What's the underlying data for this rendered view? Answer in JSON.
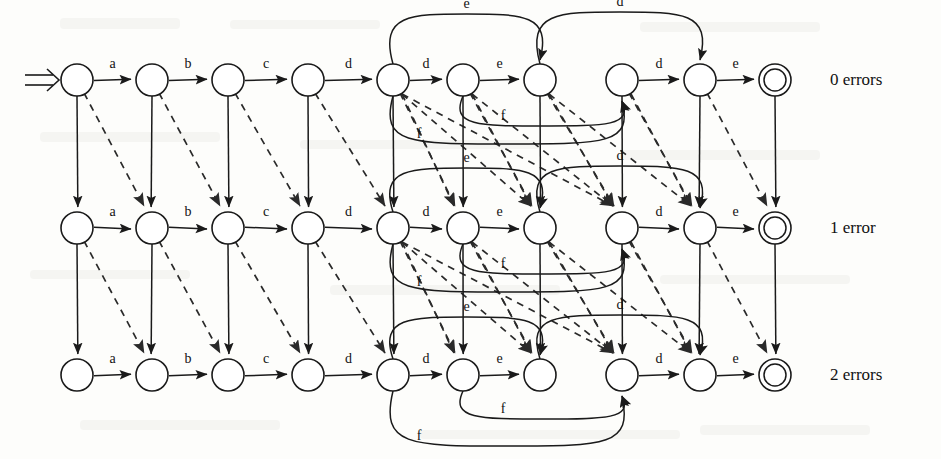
{
  "figure": {
    "row_labels": [
      {
        "id": "row0",
        "text": "0 errors"
      },
      {
        "id": "row1",
        "text": "1 error"
      },
      {
        "id": "row2",
        "text": "2 errors"
      }
    ],
    "alphabet_word": [
      "a",
      "b",
      "c",
      "d",
      "d",
      "e",
      "d",
      "e"
    ],
    "rows": [
      {
        "index": 0,
        "label": "0 errors",
        "y": 80,
        "nodes": [
          {
            "id": "r0n0",
            "cx": 77,
            "cy": 80,
            "accepting": false,
            "start": true
          },
          {
            "id": "r0n1",
            "cx": 152,
            "cy": 80,
            "accepting": false,
            "start": false
          },
          {
            "id": "r0n2",
            "cx": 228,
            "cy": 80,
            "accepting": false,
            "start": false
          },
          {
            "id": "r0n3",
            "cx": 308,
            "cy": 80,
            "accepting": false,
            "start": false
          },
          {
            "id": "r0n4",
            "cx": 393,
            "cy": 80,
            "accepting": false,
            "start": false
          },
          {
            "id": "r0n5",
            "cx": 463,
            "cy": 80,
            "accepting": false,
            "start": false
          },
          {
            "id": "r0n6",
            "cx": 540,
            "cy": 80,
            "accepting": false,
            "start": false
          },
          {
            "id": "r0n7",
            "cx": 622,
            "cy": 80,
            "accepting": false,
            "start": false
          },
          {
            "id": "r0n8",
            "cx": 700,
            "cy": 80,
            "accepting": false,
            "start": false
          },
          {
            "id": "r0n9",
            "cx": 775,
            "cy": 80,
            "accepting": true,
            "start": false
          }
        ],
        "horizontal_labels": [
          "a",
          "b",
          "c",
          "d",
          "d",
          "e",
          "",
          "d",
          "e"
        ],
        "arcs_over": [
          {
            "from": 4,
            "to": 6,
            "label": "e",
            "rise": 50
          },
          {
            "from": 6,
            "to": 8,
            "label": "d",
            "rise": 52
          }
        ],
        "arcs_under": [
          {
            "from": 5,
            "to": 7,
            "label": "f",
            "drop": 30
          },
          {
            "from": 4,
            "to": 7,
            "label": "f",
            "drop": 48
          }
        ]
      },
      {
        "index": 1,
        "label": "1 error",
        "y": 228,
        "nodes": [
          {
            "id": "r1n0",
            "cx": 77,
            "cy": 228,
            "accepting": false,
            "start": false
          },
          {
            "id": "r1n1",
            "cx": 152,
            "cy": 228,
            "accepting": false,
            "start": false
          },
          {
            "id": "r1n2",
            "cx": 228,
            "cy": 228,
            "accepting": false,
            "start": false
          },
          {
            "id": "r1n3",
            "cx": 308,
            "cy": 228,
            "accepting": false,
            "start": false
          },
          {
            "id": "r1n4",
            "cx": 393,
            "cy": 228,
            "accepting": false,
            "start": false
          },
          {
            "id": "r1n5",
            "cx": 463,
            "cy": 228,
            "accepting": false,
            "start": false
          },
          {
            "id": "r1n6",
            "cx": 540,
            "cy": 228,
            "accepting": false,
            "start": false
          },
          {
            "id": "r1n7",
            "cx": 622,
            "cy": 228,
            "accepting": false,
            "start": false
          },
          {
            "id": "r1n8",
            "cx": 700,
            "cy": 228,
            "accepting": false,
            "start": false
          },
          {
            "id": "r1n9",
            "cx": 775,
            "cy": 228,
            "accepting": true,
            "start": false
          }
        ],
        "horizontal_labels": [
          "a",
          "b",
          "c",
          "d",
          "d",
          "e",
          "",
          "d",
          "e"
        ],
        "arcs_over": [
          {
            "from": 4,
            "to": 6,
            "label": "e",
            "rise": 44
          },
          {
            "from": 6,
            "to": 8,
            "label": "d",
            "rise": 46
          }
        ],
        "arcs_under": [
          {
            "from": 5,
            "to": 7,
            "label": "f",
            "drop": 30
          },
          {
            "from": 4,
            "to": 7,
            "label": "f",
            "drop": 48
          }
        ]
      },
      {
        "index": 2,
        "label": "2 errors",
        "y": 375,
        "nodes": [
          {
            "id": "r2n0",
            "cx": 77,
            "cy": 375,
            "accepting": false,
            "start": false
          },
          {
            "id": "r2n1",
            "cx": 152,
            "cy": 375,
            "accepting": false,
            "start": false
          },
          {
            "id": "r2n2",
            "cx": 228,
            "cy": 375,
            "accepting": false,
            "start": false
          },
          {
            "id": "r2n3",
            "cx": 308,
            "cy": 375,
            "accepting": false,
            "start": false
          },
          {
            "id": "r2n4",
            "cx": 393,
            "cy": 375,
            "accepting": false,
            "start": false
          },
          {
            "id": "r2n5",
            "cx": 463,
            "cy": 375,
            "accepting": false,
            "start": false
          },
          {
            "id": "r2n6",
            "cx": 540,
            "cy": 375,
            "accepting": false,
            "start": false
          },
          {
            "id": "r2n7",
            "cx": 622,
            "cy": 375,
            "accepting": false,
            "start": false
          },
          {
            "id": "r2n8",
            "cx": 700,
            "cy": 375,
            "accepting": false,
            "start": false
          },
          {
            "id": "r2n9",
            "cx": 775,
            "cy": 375,
            "accepting": true,
            "start": false
          }
        ],
        "horizontal_labels": [
          "a",
          "b",
          "c",
          "d",
          "d",
          "e",
          "",
          "d",
          "e"
        ],
        "arcs_over": [
          {
            "from": 4,
            "to": 6,
            "label": "e",
            "rise": 42
          },
          {
            "from": 6,
            "to": 8,
            "label": "d",
            "rise": 44
          }
        ],
        "arcs_under": [
          {
            "from": 5,
            "to": 7,
            "label": "f",
            "drop": 28
          },
          {
            "from": 4,
            "to": 7,
            "label": "f",
            "drop": 55
          }
        ]
      }
    ],
    "vertical_edges_note": "solid vertical = deletion, dashed diagonal = substitution",
    "node_radius": 16,
    "accept_inner_radius": 11,
    "colors": {
      "stroke": "#1a1a1a",
      "dashed_stroke": "#2a2a2a",
      "background": "#fdfdfb",
      "text": "#111111"
    }
  }
}
